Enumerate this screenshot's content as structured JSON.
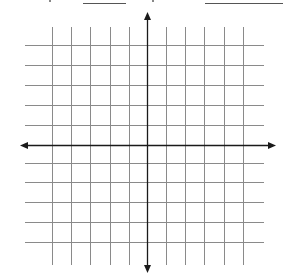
{
  "header": {
    "note": "top text row cropped out of frame; only two answer blanks visible",
    "blanks": [
      {
        "name": "blank-1",
        "x": 83,
        "width": 43
      },
      {
        "name": "blank-2",
        "x": 205,
        "width": 78
      }
    ]
  },
  "grid": {
    "line_color": "#8a8a8a",
    "axis_color": "#1a1a1a",
    "vertical_lines_x": [
      52,
      71,
      90,
      110,
      129,
      166,
      185,
      204,
      224,
      243
    ],
    "vertical_span": [
      27,
      265
    ],
    "horizontal_lines_y": [
      45,
      65,
      85,
      105,
      125,
      163,
      182,
      202,
      222,
      242
    ],
    "horizontal_span": [
      25,
      264
    ],
    "y_axis": {
      "x": 147,
      "y_start": 12,
      "y_end": 273,
      "arrows": [
        "up",
        "down"
      ]
    },
    "x_axis": {
      "y": 145,
      "x_start": 20,
      "x_end": 276,
      "arrows": [
        "left",
        "right"
      ]
    },
    "lines_per_side": 5
  }
}
